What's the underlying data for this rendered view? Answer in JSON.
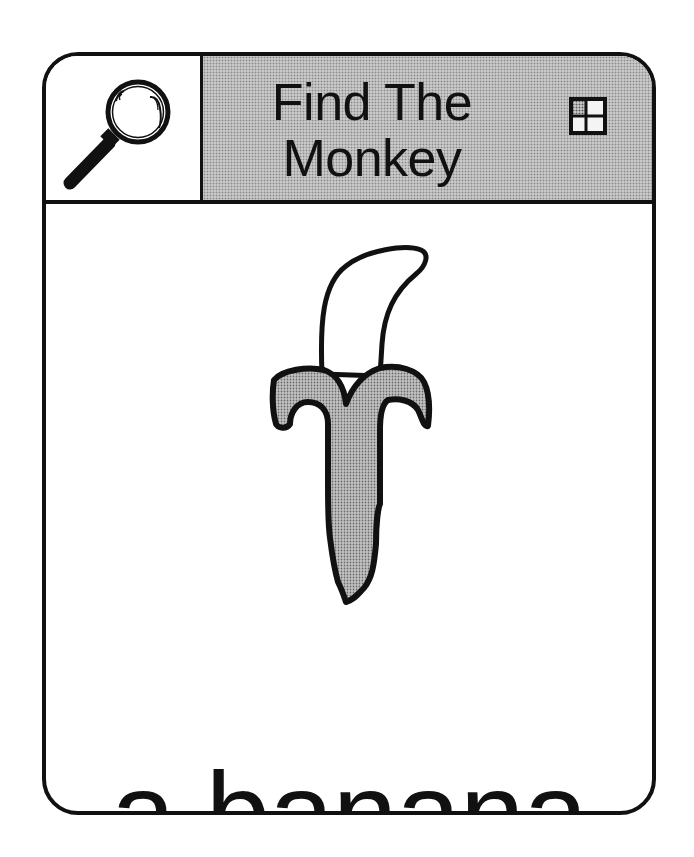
{
  "card": {
    "header": {
      "search_icon": "magnifying-glass-icon",
      "title_lines": [
        "Find The",
        "Monkey"
      ],
      "menu_icon": "grid-icon"
    },
    "body": {
      "picture": "banana-illustration",
      "caption": "a banana"
    }
  },
  "colors": {
    "ink": "#111111",
    "paper": "#ffffff",
    "header_pattern": "#c8c8c8",
    "peel_pattern": "#a8a8a8"
  }
}
